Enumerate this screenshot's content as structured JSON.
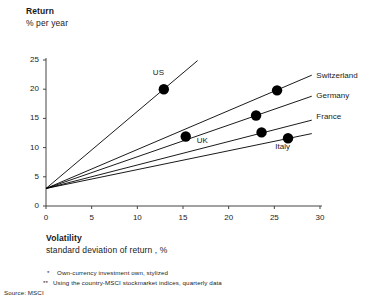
{
  "axes": {
    "y_title": "Return",
    "y_subtitle": "% per year",
    "x_title": "Volatility",
    "x_subtitle": "standard deviation of return  , %"
  },
  "footnotes": {
    "note_1_mark": "*",
    "note_1": "Own-currency investment own, stylized",
    "note_2_mark": "**",
    "note_2": "Using the country-MSCI stockmarket indices, quarterly data",
    "source": "Source:  MSCI"
  },
  "chart_data": {
    "type": "scatter",
    "title": "",
    "xlabel": "Volatility — standard deviation of return , %",
    "ylabel": "Return — % per year",
    "xlim": [
      0,
      30
    ],
    "ylim": [
      0,
      25
    ],
    "xticks": [
      0,
      5,
      10,
      15,
      20,
      25,
      30
    ],
    "yticks": [
      0,
      5,
      10,
      15,
      20,
      25
    ],
    "xtick_labels": [
      "0",
      "5",
      "10",
      "15",
      "20",
      "25",
      "30"
    ],
    "ytick_labels": [
      "0",
      "5",
      "10",
      "15",
      "20",
      "25"
    ],
    "grid": false,
    "legend": "inline-labels",
    "risk_free_intercept": 3.0,
    "series": [
      {
        "name": "US",
        "label": "US",
        "point": {
          "x": 12.9,
          "y": 20.0
        },
        "line_end": {
          "x": 16.6,
          "y": 24.9
        },
        "label_pos": {
          "x": 11.7,
          "y": 22.8
        }
      },
      {
        "name": "Switzerland",
        "label": "Switzerland",
        "point": {
          "x": 25.3,
          "y": 19.8
        },
        "line_end": {
          "x": 29.1,
          "y": 22.4
        },
        "label_pos": {
          "x": 29.6,
          "y": 22.2
        }
      },
      {
        "name": "Germany",
        "label": "Germany",
        "point": {
          "x": 23.0,
          "y": 15.5
        },
        "line_end": {
          "x": 29.1,
          "y": 18.8
        },
        "label_pos": {
          "x": 29.6,
          "y": 18.8
        }
      },
      {
        "name": "France",
        "label": "France",
        "point": {
          "x": 23.6,
          "y": 12.6
        },
        "line_end": {
          "x": 29.1,
          "y": 14.7
        },
        "label_pos": {
          "x": 29.6,
          "y": 15.2
        }
      },
      {
        "name": "Italy",
        "label": "Italy",
        "point": {
          "x": 26.5,
          "y": 11.6
        },
        "line_end": {
          "x": 29.1,
          "y": 12.4
        },
        "label_pos": {
          "x": 25.1,
          "y": 10.1
        }
      },
      {
        "name": "UK",
        "label": "UK",
        "point": {
          "x": 15.3,
          "y": 11.9
        },
        "line_end": null,
        "label_pos": {
          "x": 16.5,
          "y": 11.2
        }
      }
    ],
    "marker": {
      "shape": "circle",
      "color": "#000000",
      "size": 5.2
    },
    "line_color": "#000000",
    "axis_color": "#444444"
  }
}
